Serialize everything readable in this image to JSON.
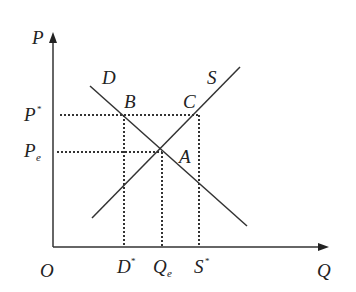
{
  "diagram": {
    "type": "supply-demand",
    "axes": {
      "y_label": "P",
      "x_label": "Q",
      "origin_label": "O"
    },
    "curves": [
      {
        "name": "D",
        "label": "D"
      },
      {
        "name": "S",
        "label": "S"
      }
    ],
    "points": [
      {
        "name": "A",
        "label": "A"
      },
      {
        "name": "B",
        "label": "B"
      },
      {
        "name": "C",
        "label": "C"
      }
    ],
    "price_labels": {
      "p_star": {
        "base": "P",
        "sup": "*"
      },
      "p_e": {
        "base": "P",
        "sub": "e"
      }
    },
    "quantity_labels": {
      "d_star": {
        "base": "D",
        "sup": "*"
      },
      "q_e": {
        "base": "Q",
        "sub": "e"
      },
      "s_star": {
        "base": "S",
        "sup": "*"
      }
    },
    "colors": {
      "line": "#333333",
      "dotted": "#333333"
    }
  }
}
